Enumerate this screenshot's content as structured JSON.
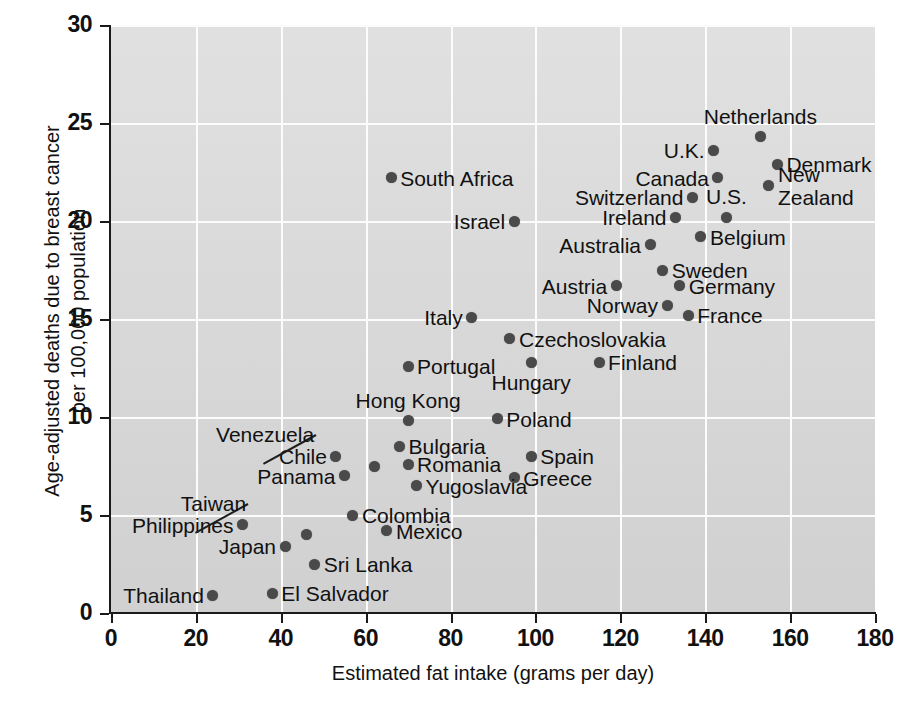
{
  "chart_data": {
    "type": "scatter",
    "title": "",
    "xlabel": "Estimated fat intake (grams per day)",
    "ylabel_line1": "Age-adjusted deaths due to breast cancer",
    "ylabel_line2": "per 100,000 population",
    "xlim": [
      0,
      180
    ],
    "ylim": [
      0,
      30
    ],
    "xticks": [
      0,
      20,
      40,
      60,
      80,
      100,
      120,
      140,
      160,
      180
    ],
    "yticks": [
      0,
      5,
      10,
      15,
      20,
      25,
      30
    ],
    "grid": true,
    "legend": "none",
    "marker": "filled-circle",
    "marker_color": "#4a4a4a",
    "plot_background": "#e4e4e4",
    "gridline_color": "#fcfcfc",
    "points": [
      {
        "label": "Netherlands",
        "x": 153,
        "y": 24.3,
        "label_pos": "above"
      },
      {
        "label": "Denmark",
        "x": 157,
        "y": 22.9,
        "label_pos": "right"
      },
      {
        "label": "U.K.",
        "x": 142,
        "y": 23.6,
        "label_pos": "left"
      },
      {
        "label": "Canada",
        "x": 143,
        "y": 22.2,
        "label_pos": "left"
      },
      {
        "label": "New Zealand",
        "x": 155,
        "y": 21.8,
        "label_pos": "right-2line"
      },
      {
        "label": "Switzerland",
        "x": 137,
        "y": 21.2,
        "label_pos": "left"
      },
      {
        "label": "U.S.",
        "x": 145,
        "y": 20.2,
        "label_pos": "above"
      },
      {
        "label": "Ireland",
        "x": 133,
        "y": 20.2,
        "label_pos": "left"
      },
      {
        "label": "Belgium",
        "x": 139,
        "y": 19.2,
        "label_pos": "right"
      },
      {
        "label": "Australia",
        "x": 127,
        "y": 18.8,
        "label_pos": "left"
      },
      {
        "label": "Sweden",
        "x": 130,
        "y": 17.5,
        "label_pos": "right"
      },
      {
        "label": "Austria",
        "x": 119,
        "y": 16.7,
        "label_pos": "left"
      },
      {
        "label": "Germany",
        "x": 134,
        "y": 16.7,
        "label_pos": "right"
      },
      {
        "label": "Norway",
        "x": 131,
        "y": 15.7,
        "label_pos": "left"
      },
      {
        "label": "France",
        "x": 136,
        "y": 15.2,
        "label_pos": "right"
      },
      {
        "label": "South Africa",
        "x": 66,
        "y": 22.2,
        "label_pos": "right"
      },
      {
        "label": "Israel",
        "x": 95,
        "y": 20.0,
        "label_pos": "left"
      },
      {
        "label": "Italy",
        "x": 85,
        "y": 15.1,
        "label_pos": "left"
      },
      {
        "label": "Czechoslovakia",
        "x": 94,
        "y": 14.0,
        "label_pos": "right"
      },
      {
        "label": "Hungary",
        "x": 99,
        "y": 12.8,
        "label_pos": "below"
      },
      {
        "label": "Finland",
        "x": 115,
        "y": 12.8,
        "label_pos": "right"
      },
      {
        "label": "Portugal",
        "x": 70,
        "y": 12.6,
        "label_pos": "right"
      },
      {
        "label": "Hong Kong",
        "x": 70,
        "y": 9.8,
        "label_pos": "above"
      },
      {
        "label": "Poland",
        "x": 91,
        "y": 9.9,
        "label_pos": "right"
      },
      {
        "label": "Bulgaria",
        "x": 68,
        "y": 8.5,
        "label_pos": "right"
      },
      {
        "label": "Spain",
        "x": 99,
        "y": 8.0,
        "label_pos": "right"
      },
      {
        "label": "Romania",
        "x": 70,
        "y": 7.6,
        "label_pos": "right"
      },
      {
        "label": "Chile",
        "x": 53,
        "y": 8.0,
        "label_pos": "left"
      },
      {
        "label": "Venezuela",
        "x": 62,
        "y": 7.5,
        "label_pos": "leader-left"
      },
      {
        "label": "Greece",
        "x": 95,
        "y": 6.9,
        "label_pos": "right"
      },
      {
        "label": "Panama",
        "x": 55,
        "y": 7.0,
        "label_pos": "left"
      },
      {
        "label": "Yugoslavia",
        "x": 72,
        "y": 6.5,
        "label_pos": "right"
      },
      {
        "label": "Colombia",
        "x": 57,
        "y": 5.0,
        "label_pos": "right"
      },
      {
        "label": "Philippines",
        "x": 31,
        "y": 4.5,
        "label_pos": "left"
      },
      {
        "label": "Mexico",
        "x": 65,
        "y": 4.2,
        "label_pos": "right"
      },
      {
        "label": "Taiwan",
        "x": 46,
        "y": 4.0,
        "label_pos": "leader-left"
      },
      {
        "label": "Japan",
        "x": 41,
        "y": 3.4,
        "label_pos": "left"
      },
      {
        "label": "Sri Lanka",
        "x": 48,
        "y": 2.5,
        "label_pos": "right"
      },
      {
        "label": "Thailand",
        "x": 24,
        "y": 0.9,
        "label_pos": "left"
      },
      {
        "label": "El Salvador",
        "x": 38,
        "y": 1.0,
        "label_pos": "right"
      }
    ]
  }
}
